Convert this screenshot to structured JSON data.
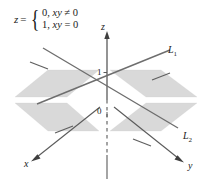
{
  "figure": {
    "background_color": "#ffffff",
    "plane_fill_color": "#d8d8d8",
    "line_color": "#6e6e6e",
    "axis_color": "#555555",
    "text_color": "#1a1a1a"
  },
  "formula": {
    "lhs": "z",
    "equals": "=",
    "cases": [
      {
        "value": "0,",
        "condition_var": "xy",
        "condition_op": "≠",
        "condition_val": "0"
      },
      {
        "value": "1,",
        "condition_var": "xy",
        "condition_op": "=",
        "condition_val": "0"
      }
    ]
  },
  "axes": [
    {
      "name": "z",
      "label": "z"
    },
    {
      "name": "x",
      "label": "x"
    },
    {
      "name": "y",
      "label": "y"
    }
  ],
  "ticks": [
    {
      "name": "z-one",
      "label": "1"
    },
    {
      "name": "origin",
      "label": "0"
    }
  ],
  "lines": [
    {
      "name": "L1",
      "label": "L",
      "subscript": "1"
    },
    {
      "name": "L2",
      "label": "L",
      "subscript": "2"
    }
  ]
}
